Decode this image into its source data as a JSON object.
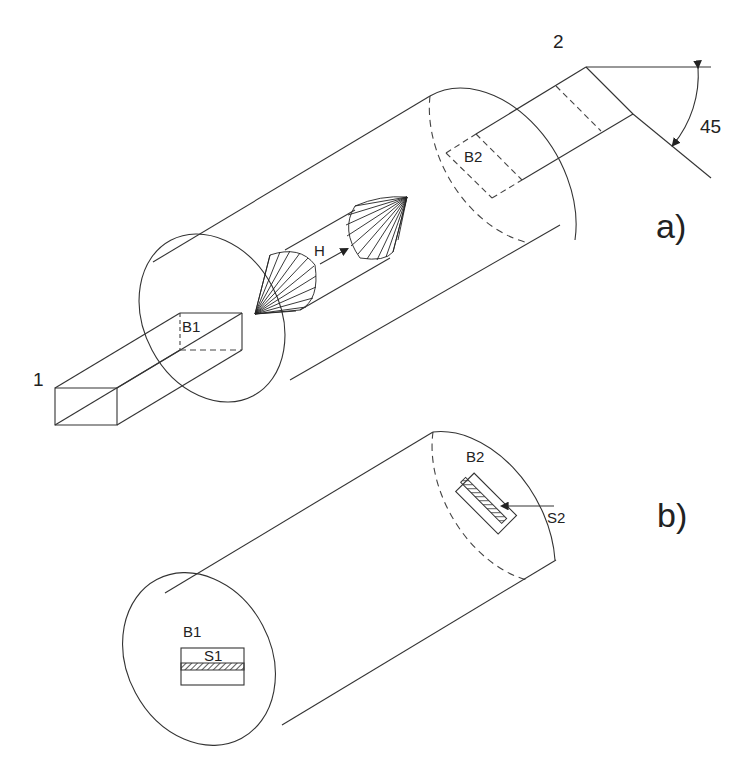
{
  "figure": {
    "panel_a": {
      "label": "a)",
      "port_1_label": "1",
      "port_2_label": "2",
      "box_1_label": "B1",
      "box_2_label": "B2",
      "field_label": "H",
      "angle_label": "45"
    },
    "panel_b": {
      "label": "b)",
      "box_1_label": "B1",
      "box_2_label": "B2",
      "slot_1_label": "S1",
      "slot_2_label": "S2"
    }
  }
}
